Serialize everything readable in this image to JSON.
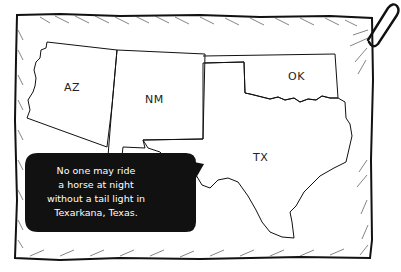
{
  "map": {
    "states": [
      {
        "id": "az",
        "label": "AZ"
      },
      {
        "id": "nm",
        "label": "NM"
      },
      {
        "id": "ok",
        "label": "OK"
      },
      {
        "id": "tx",
        "label": "TX"
      }
    ]
  },
  "bubble": {
    "lines": [
      "No one may ride",
      "a horse at night",
      "without a tail light in",
      "Texarkana, Texas."
    ]
  },
  "colors": {
    "ink": "#111111",
    "paper": "#ffffff",
    "bubble_fill": "#111111",
    "bubble_text": "#ffffff"
  }
}
